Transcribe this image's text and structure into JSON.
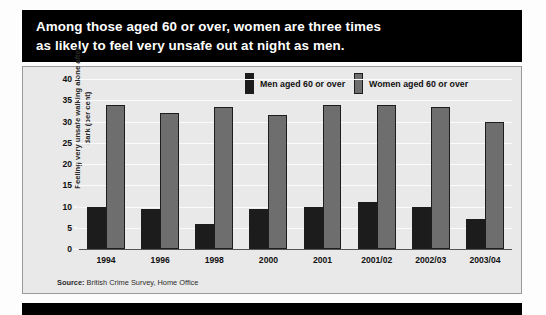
{
  "title": {
    "line1": "Among those aged 60 or over, women are three times",
    "line2": "as likely to feel very unsafe out at night as men."
  },
  "source": {
    "label": "Source:",
    "text": " British Crime Survey, Home Office"
  },
  "legend": {
    "men_label": "Men aged 60 or over",
    "women_label": "Women aged 60 or over"
  },
  "colors": {
    "men": "#1c1c1c",
    "women": "#6e6e6e",
    "panel": "#e9e9e9",
    "banner": "#000000",
    "gridline": "#fbfbfb"
  },
  "chart_data": {
    "type": "bar",
    "title": "Among those aged 60 or over, women are three times as likely to feel very unsafe out at night as men.",
    "xlabel": "",
    "ylabel": "Feeling very unsafe walking alone after dark (per cent)",
    "ylim": [
      0,
      40
    ],
    "yticks": [
      0,
      5,
      10,
      15,
      20,
      25,
      30,
      35,
      40
    ],
    "ytick_labels": [
      "0",
      "5",
      "10",
      "15",
      "20",
      "25",
      "30",
      "35",
      "40"
    ],
    "grid": true,
    "legend_position": "top-right",
    "categories": [
      "1994",
      "1996",
      "1998",
      "2000",
      "2001",
      "2001/02",
      "2002/03",
      "2003/04"
    ],
    "series": [
      {
        "name": "Men aged 60 or over",
        "color": "#1c1c1c",
        "values": [
          10,
          9.5,
          6,
          9.5,
          10,
          11,
          10,
          7
        ]
      },
      {
        "name": "Women aged 60 or over",
        "color": "#6e6e6e",
        "values": [
          34,
          32,
          33.5,
          31.5,
          34,
          34,
          33.5,
          30
        ]
      }
    ]
  }
}
